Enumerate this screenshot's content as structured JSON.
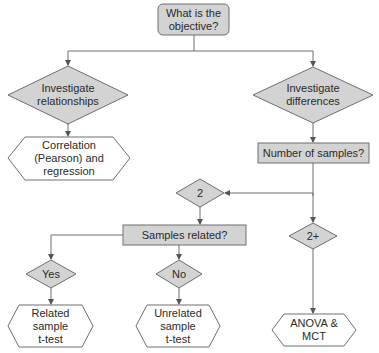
{
  "colors": {
    "shape_fill": "#d3d3d3",
    "shape_stroke": "#6e6e6e",
    "terminal_fill": "#ffffff",
    "line": "#6e6e6e",
    "text": "#2a2a2a"
  },
  "nodes": {
    "start": {
      "label": "What is the\nobjective?"
    },
    "relationships": {
      "label": "Investigate\nrelationships"
    },
    "differences": {
      "label": "Investigate\ndifferences"
    },
    "correlation": {
      "label": "Correlation\n(Pearson) and\nregression"
    },
    "num_samples": {
      "label": "Number of samples?"
    },
    "two": {
      "label": "2"
    },
    "two_plus": {
      "label": "2+"
    },
    "samples_related": {
      "label": "Samples related?"
    },
    "yes": {
      "label": "Yes"
    },
    "no": {
      "label": "No"
    },
    "related_ttest": {
      "label": "Related\nsample\nt-test"
    },
    "unrelated_ttest": {
      "label": "Unrelated\nsample\nt-test"
    },
    "anova": {
      "label": "ANOVA &\nMCT"
    }
  }
}
